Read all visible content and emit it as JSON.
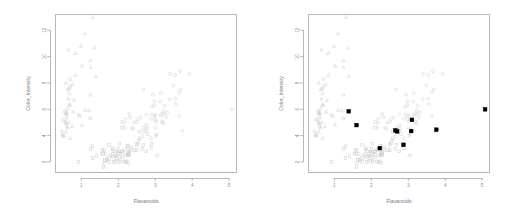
{
  "figure": {
    "background": "#ffffff",
    "panel_count": 2,
    "marker_color": "#cfcfcf",
    "highlight_color": "#000000",
    "axis_color": "#9a9a9a"
  },
  "panels": [
    {
      "name": "left-panel",
      "title": "",
      "has_highlights": false
    },
    {
      "name": "right-panel",
      "title": "",
      "has_highlights": true
    }
  ],
  "chart_data": [
    {
      "type": "scatter",
      "panel": "left",
      "title": "",
      "xlabel": "Flavanoids",
      "ylabel": "Color_Intensity",
      "xlim": [
        0.3,
        5.2
      ],
      "ylim": [
        1.2,
        13.2
      ],
      "xticks": [
        1,
        2,
        3,
        4,
        5
      ],
      "yticks": [
        2,
        4,
        6,
        8,
        10,
        12
      ],
      "grid": false,
      "legend": "none",
      "series": [
        {
          "name": "class-1",
          "marker": "circle",
          "color": "#cfcfcf",
          "points": [
            [
              2.29,
              5.64
            ],
            [
              2.76,
              4.38
            ],
            [
              3.24,
              5.68
            ],
            [
              3.49,
              7.8
            ],
            [
              2.69,
              4.32
            ],
            [
              3.39,
              6.75
            ],
            [
              2.52,
              5.25
            ],
            [
              2.51,
              5.05
            ],
            [
              2.98,
              5.2
            ],
            [
              3.15,
              7.22
            ],
            [
              3.32,
              5.75
            ],
            [
              2.43,
              5.0
            ],
            [
              2.76,
              5.6
            ],
            [
              3.69,
              7.5
            ],
            [
              3.64,
              7.3
            ],
            [
              2.91,
              6.2
            ],
            [
              3.14,
              6.6
            ],
            [
              3.4,
              8.7
            ],
            [
              3.93,
              8.7
            ],
            [
              3.03,
              5.1
            ],
            [
              3.17,
              5.65
            ],
            [
              2.41,
              4.5
            ],
            [
              2.88,
              3.8
            ],
            [
              2.37,
              4.6
            ],
            [
              2.61,
              5.4
            ],
            [
              2.68,
              7.5
            ],
            [
              2.94,
              7.1
            ],
            [
              2.19,
              5.3
            ],
            [
              2.97,
              6.3
            ],
            [
              2.33,
              5.4
            ],
            [
              3.25,
              6.25
            ],
            [
              2.99,
              5.45
            ],
            [
              2.17,
              5.0
            ],
            [
              3.54,
              6.8
            ],
            [
              2.17,
              4.6
            ],
            [
              2.92,
              5.6
            ],
            [
              3.54,
              8.6
            ],
            [
              2.68,
              4.6
            ],
            [
              2.65,
              3.93
            ],
            [
              2.76,
              4.8
            ],
            [
              2.98,
              6.62
            ],
            [
              3.15,
              5.5
            ],
            [
              3.23,
              5.88
            ],
            [
              3.67,
              8.9
            ],
            [
              3.29,
              5.4
            ],
            [
              3.56,
              6.4
            ],
            [
              3.19,
              5.1
            ],
            [
              2.78,
              4.56
            ],
            [
              3.0,
              5.58
            ],
            [
              3.19,
              5.0
            ],
            [
              3.64,
              5.5
            ],
            [
              2.1,
              5.05
            ],
            [
              3.0,
              4.6
            ],
            [
              3.23,
              4.9
            ],
            [
              2.88,
              5.28
            ],
            [
              3.74,
              4.35
            ],
            [
              5.08,
              6.0
            ],
            [
              3.04,
              4.1
            ]
          ]
        },
        {
          "name": "class-2",
          "marker": "square",
          "color": "#cfcfcf",
          "points": [
            [
              2.14,
              2.9
            ],
            [
              1.57,
              2.93
            ],
            [
              2.03,
              2.12
            ],
            [
              1.75,
              3.3
            ],
            [
              2.1,
              4.6
            ],
            [
              2.27,
              2.62
            ],
            [
              1.61,
              1.9
            ],
            [
              1.69,
              2.12
            ],
            [
              2.27,
              3.25
            ],
            [
              1.25,
              5.3
            ],
            [
              2.27,
              2.5
            ],
            [
              1.92,
              2.06
            ],
            [
              2.03,
              3.38
            ],
            [
              2.25,
              2.5
            ],
            [
              1.69,
              2.2
            ],
            [
              2.0,
              2.7
            ],
            [
              2.0,
              3.0
            ],
            [
              1.3,
              3.2
            ],
            [
              1.66,
              2.6
            ],
            [
              1.25,
              3.0
            ],
            [
              1.85,
              3.05
            ],
            [
              2.58,
              3.8
            ],
            [
              2.55,
              3.6
            ],
            [
              1.64,
              2.15
            ],
            [
              1.79,
              2.5
            ],
            [
              2.03,
              2.0
            ],
            [
              1.85,
              2.6
            ],
            [
              1.75,
              2.0
            ],
            [
              1.85,
              2.4
            ],
            [
              1.61,
              2.9
            ],
            [
              2.65,
              3.0
            ],
            [
              2.1,
              2.8
            ],
            [
              2.53,
              3.4
            ],
            [
              1.41,
              2.45
            ],
            [
              2.29,
              2.55
            ],
            [
              1.59,
              2.6
            ],
            [
              2.58,
              4.3
            ],
            [
              2.5,
              2.9
            ],
            [
              1.6,
              1.6
            ],
            [
              2.02,
              2.4
            ],
            [
              2.26,
              3.0
            ],
            [
              1.85,
              2.95
            ],
            [
              2.27,
              1.9
            ],
            [
              2.2,
              2.0
            ],
            [
              2.24,
              3.2
            ],
            [
              2.76,
              2.8
            ],
            [
              2.19,
              2.5
            ],
            [
              1.89,
              2.8
            ],
            [
              1.75,
              2.3
            ],
            [
              2.35,
              3.1
            ],
            [
              1.98,
              2.8
            ],
            [
              2.68,
              3.3
            ],
            [
              2.9,
              3.38
            ],
            [
              2.35,
              2.9
            ],
            [
              3.05,
              2.5
            ],
            [
              2.89,
              3.05
            ],
            [
              2.8,
              4.12
            ],
            [
              3.03,
              4.0
            ],
            [
              0.92,
              2.0
            ],
            [
              2.23,
              2.05
            ],
            [
              1.55,
              2.65
            ],
            [
              1.3,
              2.3
            ],
            [
              2.06,
              2.62
            ],
            [
              2.26,
              2.68
            ],
            [
              1.95,
              2.5
            ],
            [
              2.1,
              2.76
            ],
            [
              2.12,
              2.35
            ],
            [
              1.92,
              2.45
            ],
            [
              2.5,
              3.3
            ],
            [
              2.3,
              2.78
            ],
            [
              2.15,
              2.04
            ],
            [
              1.96,
              2.3
            ],
            [
              1.88,
              2.0
            ],
            [
              2.45,
              2.9
            ],
            [
              2.3,
              2.6
            ]
          ]
        },
        {
          "name": "class-3",
          "marker": "triangle",
          "color": "#cfcfcf",
          "points": [
            [
              0.6,
              5.4
            ],
            [
              0.5,
              4.0
            ],
            [
              0.69,
              3.8
            ],
            [
              0.61,
              5.65
            ],
            [
              0.66,
              5.0
            ],
            [
              0.63,
              4.6
            ],
            [
              0.58,
              5.0
            ],
            [
              0.57,
              5.7
            ],
            [
              0.68,
              7.2
            ],
            [
              0.47,
              4.35
            ],
            [
              0.49,
              4.1
            ],
            [
              0.6,
              5.8
            ],
            [
              0.56,
              5.1
            ],
            [
              0.6,
              4.9
            ],
            [
              0.5,
              5.25
            ],
            [
              0.58,
              5.7
            ],
            [
              0.66,
              7.6
            ],
            [
              1.25,
              9.7
            ],
            [
              1.31,
              13.0
            ],
            [
              1.1,
              11.75
            ],
            [
              1.36,
              10.68
            ],
            [
              0.84,
              10.26
            ],
            [
              0.99,
              10.8
            ],
            [
              0.65,
              10.52
            ],
            [
              1.02,
              9.3
            ],
            [
              1.25,
              9.2
            ],
            [
              0.84,
              8.6
            ],
            [
              0.76,
              7.9
            ],
            [
              0.58,
              8.0
            ],
            [
              0.7,
              7.7
            ],
            [
              1.39,
              8.5
            ],
            [
              1.25,
              7.1
            ],
            [
              0.68,
              6.4
            ],
            [
              0.92,
              5.6
            ],
            [
              1.2,
              5.9
            ],
            [
              1.1,
              5.95
            ],
            [
              0.75,
              4.7
            ],
            [
              0.8,
              6.7
            ],
            [
              0.78,
              5.8
            ],
            [
              0.7,
              6.3
            ],
            [
              0.63,
              6.1
            ],
            [
              0.55,
              5.9
            ],
            [
              0.6,
              4.7
            ],
            [
              0.58,
              4.3
            ],
            [
              0.52,
              4.0
            ],
            [
              0.7,
              8.3
            ],
            [
              0.63,
              7.5
            ],
            [
              0.65,
              6.8
            ],
            [
              1.02,
              4.8
            ],
            [
              0.96,
              5.5
            ]
          ]
        }
      ]
    },
    {
      "type": "scatter",
      "panel": "right",
      "title": "",
      "xlabel": "Flavanoids",
      "ylabel": "Color_Intensity",
      "xlim": [
        0.3,
        5.2
      ],
      "ylim": [
        1.2,
        13.2
      ],
      "xticks": [
        1,
        2,
        3,
        4,
        5
      ],
      "yticks": [
        2,
        4,
        6,
        8,
        10,
        12
      ],
      "grid": false,
      "legend": "none",
      "highlighted": {
        "name": "highlighted-points",
        "marker": "filled-square",
        "color": "#000000",
        "points": [
          [
            1.39,
            5.85
          ],
          [
            1.6,
            4.8
          ],
          [
            2.23,
            3.05
          ],
          [
            2.65,
            4.4
          ],
          [
            2.7,
            4.32
          ],
          [
            2.87,
            3.3
          ],
          [
            3.1,
            5.2
          ],
          [
            3.08,
            4.35
          ],
          [
            3.76,
            4.45
          ],
          [
            5.08,
            6.0
          ]
        ]
      }
    }
  ]
}
